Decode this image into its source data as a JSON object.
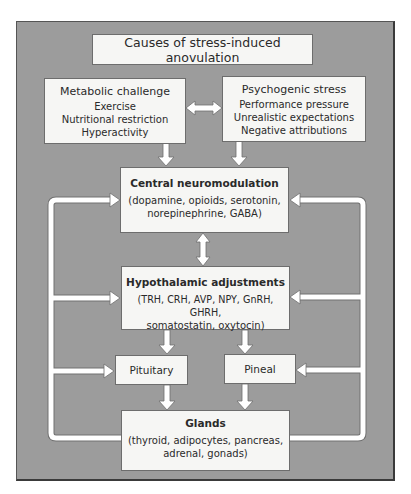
{
  "diagram": {
    "title": "Causes of stress-induced anovulation",
    "metabolic": {
      "heading": "Metabolic challenge",
      "items": [
        "Exercise",
        "Nutritional restriction",
        "Hyperactivity"
      ]
    },
    "psychogenic": {
      "heading": "Psychogenic stress",
      "items": [
        "Performance pressure",
        "Unrealistic expectations",
        "Negative attributions"
      ]
    },
    "central": {
      "heading": "Central neuromodulation",
      "lines": [
        "(dopamine, opioids, serotonin,",
        "norepinephrine, GABA)"
      ]
    },
    "hypothalamic": {
      "heading": "Hypothalamic adjustments",
      "lines": [
        "(TRH, CRH, AVP, NPY, GnRH, GHRH,",
        "somatostatin, oxytocin)"
      ]
    },
    "pituitary": {
      "label": "Pituitary"
    },
    "pineal": {
      "label": "Pineal"
    },
    "glands": {
      "heading": "Glands",
      "lines": [
        "(thyroid, adipocytes, pancreas,",
        "adrenal, gonads)"
      ]
    },
    "colors": {
      "frame_bg": "#9c9c9c",
      "box_fill": "#f6f6f4",
      "arrow_fill": "#ffffff",
      "border": "#6d6d6d"
    }
  }
}
